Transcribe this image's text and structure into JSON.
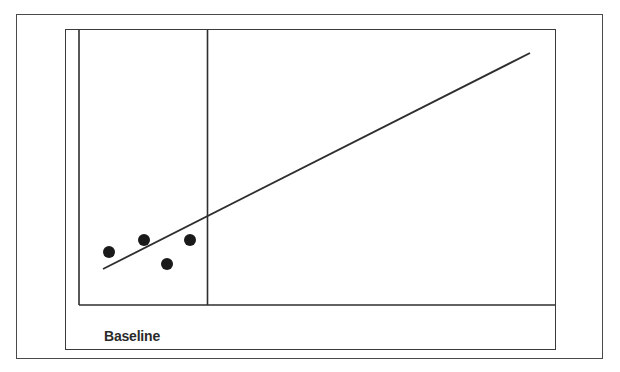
{
  "diagram": {
    "caption_label": "Baseline",
    "colors": {
      "stroke": "#333333",
      "dot": "#1a1a1a",
      "background": "#ffffff"
    },
    "phases": [
      {
        "name": "Baseline"
      }
    ],
    "data_points": [
      {
        "x": 109,
        "y": 252
      },
      {
        "x": 144,
        "y": 240
      },
      {
        "x": 190,
        "y": 240
      },
      {
        "x": 167,
        "y": 264
      }
    ],
    "trend_line": {
      "x1": 103,
      "y1": 269,
      "x2": 530,
      "y2": 53
    }
  }
}
